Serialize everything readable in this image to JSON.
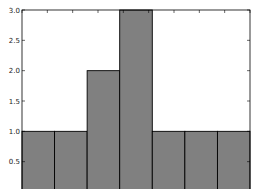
{
  "chart_data": {
    "type": "bar",
    "subtype": "histogram",
    "title": "",
    "xlabel": "",
    "ylabel": "",
    "bins": 7,
    "bin_edges": [
      26,
      28.571,
      31.143,
      33.714,
      36.286,
      38.857,
      41.429,
      44
    ],
    "categories": [
      "26-28.6",
      "28.6-31.1",
      "31.1-33.7",
      "33.7-36.3",
      "36.3-38.9",
      "38.9-41.4",
      "41.4-44"
    ],
    "values": [
      1,
      1,
      2,
      3,
      1,
      1,
      1
    ],
    "xlim": [
      26,
      44
    ],
    "ylim": [
      0,
      3.0
    ],
    "x_ticks": [
      26,
      28,
      30,
      32,
      34,
      36,
      38,
      40,
      42,
      44
    ],
    "x_tick_labels": [
      "26",
      "28",
      "30",
      "32",
      "34",
      "36",
      "38",
      "40",
      "42",
      "44"
    ],
    "y_ticks": [
      0.0,
      0.5,
      1.0,
      1.5,
      2.0,
      2.5,
      3.0
    ],
    "y_tick_labels": [
      "0.0",
      "0.5",
      "1.0",
      "1.5",
      "2.0",
      "2.5",
      "3.0"
    ],
    "grid": false,
    "legend": null,
    "colors": {
      "bar_fill": "#808080",
      "bar_edge": "#000000",
      "axes": "#000000",
      "background": "#ffffff"
    }
  }
}
